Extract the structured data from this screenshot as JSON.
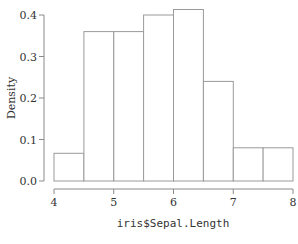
{
  "chart_data": {
    "type": "bar",
    "subtype": "histogram",
    "title": "",
    "xlabel": "iris$Sepal.Length",
    "ylabel": "Density",
    "bins": [
      {
        "start": 4.0,
        "end": 4.5,
        "density": 0.0667
      },
      {
        "start": 4.5,
        "end": 5.0,
        "density": 0.36
      },
      {
        "start": 5.0,
        "end": 5.5,
        "density": 0.36
      },
      {
        "start": 5.5,
        "end": 6.0,
        "density": 0.4
      },
      {
        "start": 6.0,
        "end": 6.5,
        "density": 0.4133
      },
      {
        "start": 6.5,
        "end": 7.0,
        "density": 0.24
      },
      {
        "start": 7.0,
        "end": 7.5,
        "density": 0.08
      },
      {
        "start": 7.5,
        "end": 8.0,
        "density": 0.08
      }
    ],
    "categories": [
      "4-4.5",
      "4.5-5",
      "5-5.5",
      "5.5-6",
      "6-6.5",
      "6.5-7",
      "7-7.5",
      "7.5-8"
    ],
    "values": [
      0.0667,
      0.36,
      0.36,
      0.4,
      0.4133,
      0.24,
      0.08,
      0.08
    ],
    "xlim": [
      4,
      8
    ],
    "ylim": [
      0,
      0.4
    ],
    "x_ticks": [
      "4",
      "5",
      "6",
      "7",
      "8"
    ],
    "y_ticks": [
      "0.0",
      "0.1",
      "0.2",
      "0.3",
      "0.4"
    ],
    "grid": false,
    "legend": null,
    "colors": {
      "bar_fill": "#ffffff",
      "bar_stroke": "#9a9a9a",
      "axis": "#8a8a8a",
      "text": "#333333"
    }
  }
}
